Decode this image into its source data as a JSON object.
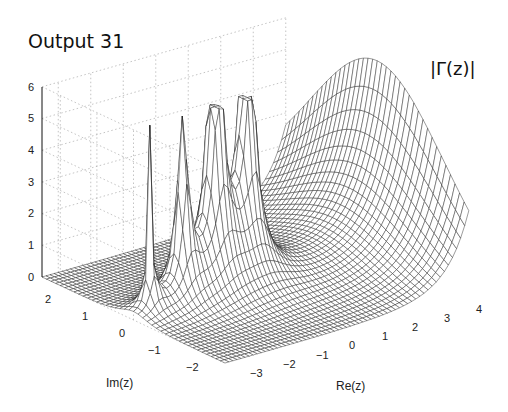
{
  "title": "Output 31",
  "chart_data": {
    "type": "surface",
    "title": "Output 31",
    "function_label": "|Γ(z)|",
    "xlabel": "Re(z)",
    "ylabel": "Im(z)",
    "zlabel": "",
    "x_ticks": [
      -3,
      -2,
      -1,
      0,
      1,
      2,
      3,
      4
    ],
    "y_ticks": [
      2,
      1,
      0,
      -1,
      -2
    ],
    "z_ticks": [
      0,
      1,
      2,
      3,
      4,
      5,
      6
    ],
    "xlim": [
      -3.5,
      4
    ],
    "ylim": [
      -2.5,
      2.5
    ],
    "zlim": [
      0,
      6
    ],
    "grid": true,
    "style": "wireframe mesh, black lines on white, dotted grid on back walls",
    "features": {
      "poles_at": [
        0,
        -1,
        -2,
        -3
      ],
      "pole_height_clipped_at": 6,
      "peak_near": {
        "re": 4,
        "im": 0,
        "value": "about 6 (Γ(4)=6)"
      },
      "minimum_valley_near": {
        "re": 1.46,
        "im": 0
      }
    }
  },
  "labels": {
    "function_label": "|Γ(z)|",
    "re_axis": "Re(z)",
    "im_axis": "Im(z)",
    "z_ticks": [
      "0",
      "1",
      "2",
      "3",
      "4",
      "5",
      "6"
    ],
    "re_ticks": [
      "−3",
      "−2",
      "−1",
      "0",
      "1",
      "2",
      "3",
      "4"
    ],
    "im_ticks": [
      "2",
      "1",
      "0",
      "−1",
      "−2"
    ]
  }
}
